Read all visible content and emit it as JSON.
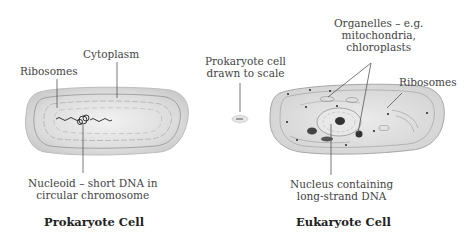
{
  "prokaryote": {
    "title": "Prokaryote Cell",
    "labels": {
      "ribosomes": "Ribosomes",
      "cytoplasm": "Cytoplasm",
      "nucleoid_line1": "Nucleoid – short DNA in",
      "nucleoid_line2": "circular chromosome"
    }
  },
  "scale": {
    "line1": "Prokaryote cell",
    "line2": "drawn to scale"
  },
  "eukaryote": {
    "title": "Eukaryote Cell",
    "labels": {
      "organelles_line1": "Organelles – e.g.",
      "organelles_line2": "mitochondria,",
      "organelles_line3": "chloroplasts",
      "ribosomes": "Ribosomes",
      "nucleus_line1": "Nucleus containing",
      "nucleus_line2": "long-strand DNA"
    }
  },
  "colors": {
    "cell_fill": "#d9d9d9",
    "line": "#555555",
    "text": "#444444"
  }
}
